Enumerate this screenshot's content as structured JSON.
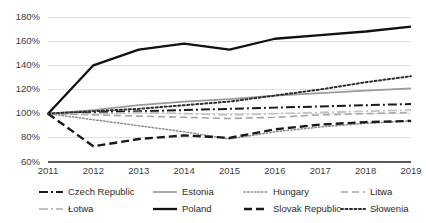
{
  "chart_data": {
    "type": "line",
    "title": "",
    "xlabel": "",
    "ylabel": "",
    "x": [
      2011,
      2012,
      2013,
      2014,
      2015,
      2016,
      2017,
      2018,
      2019
    ],
    "categories": [
      "2011",
      "2012",
      "2013",
      "2014",
      "2015",
      "2016",
      "2017",
      "2018",
      "2019"
    ],
    "ylim": [
      60,
      180
    ],
    "ytick_values": [
      60,
      80,
      100,
      120,
      140,
      160,
      180
    ],
    "ytick_labels": [
      "60%",
      "80%",
      "100%",
      "120%",
      "140%",
      "160%",
      "180%"
    ],
    "grid": true,
    "grid_axis": "y",
    "legend_position": "bottom",
    "legend_columns": 4,
    "series": [
      {
        "name": "Czech Republic",
        "values": [
          100,
          101,
          102,
          103,
          104,
          105,
          106,
          107,
          108
        ],
        "color": "#1a1a1a",
        "style": "dash-dot",
        "width": 2.0,
        "dasharray": "9,3,2,3"
      },
      {
        "name": "Estonia",
        "values": [
          100,
          103,
          107,
          110,
          112,
          115,
          117,
          119,
          121
        ],
        "color": "#9a9a9a",
        "style": "solid",
        "width": 1.7,
        "dasharray": "none"
      },
      {
        "name": "Hungary",
        "values": [
          100,
          95,
          90,
          85,
          79,
          85,
          89,
          92,
          94
        ],
        "color": "#8c8c8c",
        "style": "dotted",
        "width": 1.5,
        "dasharray": "1.5,2"
      },
      {
        "name": "Litwa",
        "values": [
          100,
          99,
          98,
          97,
          96,
          97,
          99,
          100,
          101
        ],
        "color": "#a5a5a5",
        "style": "dashed",
        "width": 1.6,
        "dasharray": "7,4"
      },
      {
        "name": "Łotwa",
        "values": [
          100,
          100,
          101,
          100,
          99,
          100,
          101,
          102,
          103
        ],
        "color": "#c2c2c2",
        "style": "dash-dot",
        "width": 1.8,
        "dasharray": "9,3,2,3"
      },
      {
        "name": "Poland",
        "values": [
          100,
          140,
          153,
          158,
          153,
          162,
          165,
          168,
          172
        ],
        "color": "#111111",
        "style": "solid",
        "width": 2.3,
        "dasharray": "none"
      },
      {
        "name": "Slovak Republic",
        "values": [
          100,
          73,
          79,
          82,
          80,
          87,
          91,
          93,
          94
        ],
        "color": "#1a1a1a",
        "style": "dashed",
        "width": 2.4,
        "dasharray": "8,4"
      },
      {
        "name": "Słowenia",
        "values": [
          100,
          102,
          104,
          107,
          110,
          115,
          120,
          126,
          131
        ],
        "color": "#2e2e2e",
        "style": "dotted",
        "width": 2.0,
        "dasharray": "2,2.5"
      }
    ]
  },
  "legend": {
    "rows": [
      [
        {
          "label": "Czech Republic",
          "series": 0
        },
        {
          "label": "Estonia",
          "series": 1
        },
        {
          "label": "Hungary",
          "series": 2
        },
        {
          "label": "Litwa",
          "series": 3
        }
      ],
      [
        {
          "label": "Łotwa",
          "series": 4
        },
        {
          "label": "Poland",
          "series": 5
        },
        {
          "label": "Slovak Republic",
          "series": 6
        },
        {
          "label": "Słowenia",
          "series": 7
        }
      ]
    ]
  },
  "axes": {
    "axis_line_color": "#595959",
    "grid_color": "#d9d9d9",
    "tick_label_color": "#3b3b3b"
  }
}
